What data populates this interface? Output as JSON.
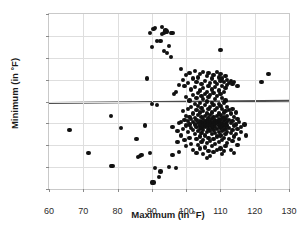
{
  "chart_data": {
    "type": "scatter",
    "title": "",
    "xlabel": "Maximum (in °F)",
    "ylabel": "Minimum (in °F)",
    "xlim": [
      60,
      130
    ],
    "ylim": [
      -80,
      80
    ],
    "xticks": [
      60,
      70,
      80,
      90,
      100,
      110,
      120,
      130
    ],
    "yticks": [
      80,
      60,
      40,
      20,
      0,
      -20,
      -40,
      -60,
      -80
    ],
    "grid": true,
    "legend": null,
    "point_color": "#111111",
    "marker_size": 4,
    "annotations": [
      {
        "type": "hline",
        "label": "fitted regression line",
        "y_left": 0,
        "y_right": 2,
        "color": "#4b4b4b"
      }
    ],
    "points": [
      [
        66,
        -26
      ],
      [
        71.5,
        -47
      ],
      [
        78,
        -13
      ],
      [
        78,
        -59
      ],
      [
        78.5,
        -59
      ],
      [
        81,
        -24
      ],
      [
        85.5,
        -34
      ],
      [
        86,
        -51
      ],
      [
        86.5,
        -50
      ],
      [
        87,
        -49
      ],
      [
        88,
        -22
      ],
      [
        88.5,
        21
      ],
      [
        89.5,
        -47
      ],
      [
        89.5,
        63
      ],
      [
        90,
        -74
      ],
      [
        90,
        -2
      ],
      [
        90,
        50
      ],
      [
        90.5,
        -74
      ],
      [
        90.5,
        66
      ],
      [
        91,
        67
      ],
      [
        91,
        -61
      ],
      [
        91.5,
        -3
      ],
      [
        91.5,
        55
      ],
      [
        92,
        -69
      ],
      [
        92.5,
        -64
      ],
      [
        92.5,
        55
      ],
      [
        93,
        68
      ],
      [
        93,
        62
      ],
      [
        93.5,
        63
      ],
      [
        93.5,
        46
      ],
      [
        94,
        65
      ],
      [
        94,
        64
      ],
      [
        94.5,
        64
      ],
      [
        94.5,
        44
      ],
      [
        95,
        51
      ],
      [
        95,
        -60
      ],
      [
        95.5,
        63
      ],
      [
        95.5,
        41
      ],
      [
        96,
        63
      ],
      [
        96,
        -49
      ],
      [
        96,
        -23
      ],
      [
        96.5,
        7
      ],
      [
        97,
        -61
      ],
      [
        97,
        9
      ],
      [
        97.5,
        -27
      ],
      [
        97.5,
        -37
      ],
      [
        98,
        15
      ],
      [
        98,
        -20
      ],
      [
        98,
        -46
      ],
      [
        98.5,
        30
      ],
      [
        98.5,
        -19
      ],
      [
        98.5,
        -31
      ],
      [
        99,
        20
      ],
      [
        99,
        -9
      ],
      [
        99,
        -25
      ],
      [
        99.5,
        14
      ],
      [
        99.5,
        -17
      ],
      [
        99.5,
        -35
      ],
      [
        100,
        24
      ],
      [
        100,
        4
      ],
      [
        100,
        -13
      ],
      [
        100,
        -22
      ],
      [
        100,
        -41
      ],
      [
        100.5,
        17
      ],
      [
        100.5,
        -7
      ],
      [
        100.5,
        -18
      ],
      [
        100.5,
        -28
      ],
      [
        101,
        26
      ],
      [
        101,
        1
      ],
      [
        101,
        -14
      ],
      [
        101,
        -21
      ],
      [
        101,
        -33
      ],
      [
        101.5,
        11
      ],
      [
        101.5,
        -5
      ],
      [
        101.5,
        -16
      ],
      [
        101.5,
        -24
      ],
      [
        101.5,
        -39
      ],
      [
        102,
        21
      ],
      [
        102,
        6
      ],
      [
        102,
        -11
      ],
      [
        102,
        -19
      ],
      [
        102,
        -26
      ],
      [
        102,
        -44
      ],
      [
        102.5,
        28
      ],
      [
        102.5,
        13
      ],
      [
        102.5,
        -2
      ],
      [
        102.5,
        -15
      ],
      [
        102.5,
        -21
      ],
      [
        102.5,
        -30
      ],
      [
        103,
        18
      ],
      [
        103,
        3
      ],
      [
        103,
        -8
      ],
      [
        103,
        -17
      ],
      [
        103,
        -23
      ],
      [
        103,
        -34
      ],
      [
        103,
        -47
      ],
      [
        103.5,
        22
      ],
      [
        103.5,
        8
      ],
      [
        103.5,
        -4
      ],
      [
        103.5,
        -12
      ],
      [
        103.5,
        -20
      ],
      [
        103.5,
        -27
      ],
      [
        103.5,
        -40
      ],
      [
        104,
        25
      ],
      [
        104,
        10
      ],
      [
        104,
        -1
      ],
      [
        104,
        -10
      ],
      [
        104,
        -18
      ],
      [
        104,
        -22
      ],
      [
        104,
        -25
      ],
      [
        104,
        -32
      ],
      [
        104,
        -43
      ],
      [
        104.5,
        16
      ],
      [
        104.5,
        5
      ],
      [
        104.5,
        -6
      ],
      [
        104.5,
        -14
      ],
      [
        104.5,
        -19
      ],
      [
        104.5,
        -21
      ],
      [
        104.5,
        -24
      ],
      [
        104.5,
        -29
      ],
      [
        104.5,
        -37
      ],
      [
        105,
        27
      ],
      [
        105,
        12
      ],
      [
        105,
        2
      ],
      [
        105,
        -9
      ],
      [
        105,
        -16
      ],
      [
        105,
        -20
      ],
      [
        105,
        -22
      ],
      [
        105,
        -26
      ],
      [
        105,
        -35
      ],
      [
        105,
        -48
      ],
      [
        105.5,
        19
      ],
      [
        105.5,
        7
      ],
      [
        105.5,
        -3
      ],
      [
        105.5,
        -13
      ],
      [
        105.5,
        -18
      ],
      [
        105.5,
        -21
      ],
      [
        105.5,
        -23
      ],
      [
        105.5,
        -31
      ],
      [
        105.5,
        -42
      ],
      [
        106,
        23
      ],
      [
        106,
        9
      ],
      [
        106,
        0
      ],
      [
        106,
        -11
      ],
      [
        106,
        -17
      ],
      [
        106,
        -20
      ],
      [
        106,
        -22
      ],
      [
        106,
        -28
      ],
      [
        106,
        -38
      ],
      [
        106,
        -52
      ],
      [
        106.5,
        26
      ],
      [
        106.5,
        14
      ],
      [
        106.5,
        4
      ],
      [
        106.5,
        -7
      ],
      [
        106.5,
        -15
      ],
      [
        106.5,
        -19
      ],
      [
        106.5,
        -21
      ],
      [
        106.5,
        -25
      ],
      [
        106.5,
        -33
      ],
      [
        106.5,
        -45
      ],
      [
        107,
        17
      ],
      [
        107,
        6
      ],
      [
        107,
        -5
      ],
      [
        107,
        -12
      ],
      [
        107,
        -18
      ],
      [
        107,
        -22
      ],
      [
        107,
        -27
      ],
      [
        107,
        -36
      ],
      [
        107,
        -50
      ],
      [
        107.5,
        21
      ],
      [
        107.5,
        11
      ],
      [
        107.5,
        -1
      ],
      [
        107.5,
        -10
      ],
      [
        107.5,
        -16
      ],
      [
        107.5,
        -20
      ],
      [
        107.5,
        -24
      ],
      [
        107.5,
        -30
      ],
      [
        107.5,
        -41
      ],
      [
        108,
        24
      ],
      [
        108,
        8
      ],
      [
        108,
        -3
      ],
      [
        108,
        -14
      ],
      [
        108,
        -19
      ],
      [
        108,
        -22
      ],
      [
        108,
        -26
      ],
      [
        108,
        -34
      ],
      [
        108,
        -46
      ],
      [
        108.5,
        18
      ],
      [
        108.5,
        13
      ],
      [
        108.5,
        2
      ],
      [
        108.5,
        -8
      ],
      [
        108.5,
        -17
      ],
      [
        108.5,
        -21
      ],
      [
        108.5,
        -23
      ],
      [
        108.5,
        -29
      ],
      [
        108.5,
        -39
      ],
      [
        109,
        27
      ],
      [
        109,
        16
      ],
      [
        109,
        5
      ],
      [
        109,
        -6
      ],
      [
        109,
        -13
      ],
      [
        109,
        -18
      ],
      [
        109,
        -20
      ],
      [
        109,
        -25
      ],
      [
        109,
        -32
      ],
      [
        109,
        -44
      ],
      [
        109.5,
        22
      ],
      [
        109.5,
        10
      ],
      [
        109.5,
        -2
      ],
      [
        109.5,
        -11
      ],
      [
        109.5,
        -16
      ],
      [
        109.5,
        -19
      ],
      [
        109.5,
        -22
      ],
      [
        109.5,
        -28
      ],
      [
        109.5,
        -37
      ],
      [
        110,
        47
      ],
      [
        110,
        25
      ],
      [
        110,
        19
      ],
      [
        110,
        7
      ],
      [
        110,
        -4
      ],
      [
        110,
        -12
      ],
      [
        110,
        -17
      ],
      [
        110,
        -21
      ],
      [
        110,
        -24
      ],
      [
        110,
        -31
      ],
      [
        110,
        -43
      ],
      [
        110.5,
        21
      ],
      [
        110.5,
        14
      ],
      [
        110.5,
        3
      ],
      [
        110.5,
        -7
      ],
      [
        110.5,
        -15
      ],
      [
        110.5,
        -20
      ],
      [
        110.5,
        -23
      ],
      [
        110.5,
        -27
      ],
      [
        110.5,
        -35
      ],
      [
        110.5,
        -48
      ],
      [
        111,
        18
      ],
      [
        111,
        9
      ],
      [
        111,
        -1
      ],
      [
        111,
        -10
      ],
      [
        111,
        -14
      ],
      [
        111,
        -18
      ],
      [
        111,
        -22
      ],
      [
        111,
        -26
      ],
      [
        111,
        -33
      ],
      [
        111,
        -45
      ],
      [
        111.5,
        23
      ],
      [
        111.5,
        12
      ],
      [
        111.5,
        1
      ],
      [
        111.5,
        -9
      ],
      [
        111.5,
        -16
      ],
      [
        111.5,
        -21
      ],
      [
        111.5,
        -25
      ],
      [
        111.5,
        -30
      ],
      [
        111.5,
        -41
      ],
      [
        112,
        20
      ],
      [
        112,
        15
      ],
      [
        112,
        -5
      ],
      [
        112,
        -13
      ],
      [
        112,
        -19
      ],
      [
        112,
        -22
      ],
      [
        112,
        -28
      ],
      [
        112,
        -38
      ],
      [
        112.5,
        17
      ],
      [
        112.5,
        -8
      ],
      [
        112.5,
        -17
      ],
      [
        112.5,
        -24
      ],
      [
        112.5,
        -34
      ],
      [
        113,
        19
      ],
      [
        113,
        -11
      ],
      [
        113,
        -20
      ],
      [
        113,
        -29
      ],
      [
        113,
        -44
      ],
      [
        113.5,
        16
      ],
      [
        113.5,
        -7
      ],
      [
        113.5,
        -18
      ],
      [
        113.5,
        -26
      ],
      [
        113.5,
        -36
      ],
      [
        114,
        18
      ],
      [
        114,
        -14
      ],
      [
        114,
        -22
      ],
      [
        114,
        -32
      ],
      [
        114,
        -47
      ],
      [
        114.5,
        -10
      ],
      [
        114.5,
        -21
      ],
      [
        114.5,
        -30
      ],
      [
        115,
        14
      ],
      [
        115,
        -16
      ],
      [
        115,
        -25
      ],
      [
        115,
        -40
      ],
      [
        115.5,
        -19
      ],
      [
        115.5,
        -34
      ],
      [
        116,
        -23
      ],
      [
        116,
        -28
      ],
      [
        117,
        -21
      ],
      [
        117.5,
        -31
      ],
      [
        122,
        18
      ],
      [
        124,
        25
      ]
    ]
  }
}
